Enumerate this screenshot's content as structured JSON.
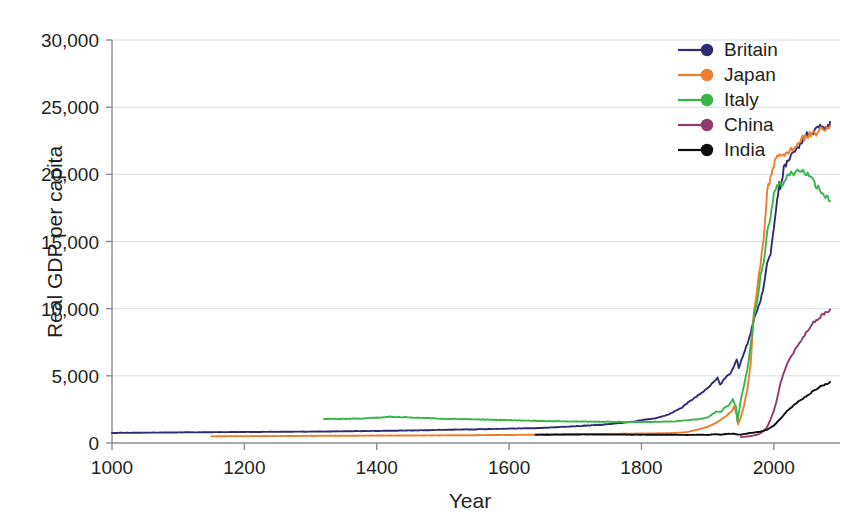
{
  "chart_data": {
    "type": "line",
    "title": "",
    "xlabel": "Year",
    "ylabel": "Real GDP per capita",
    "xlim": [
      1000,
      2100
    ],
    "ylim": [
      0,
      30000
    ],
    "xticks": [
      1000,
      1200,
      1400,
      1600,
      1800,
      2000
    ],
    "xticklabels": [
      "1000",
      "1200",
      "1400",
      "1600",
      "1800",
      "2000"
    ],
    "yticks": [
      0,
      5000,
      10000,
      15000,
      20000,
      25000,
      30000
    ],
    "yticklabels": [
      "0",
      "5,000",
      "10,000",
      "15,000",
      "20,000",
      "25,000",
      "30,000"
    ],
    "grid": true,
    "grid_axis": "y",
    "legend_position": "top-right",
    "series": [
      {
        "name": "Britain",
        "color": "#2e2d74",
        "x": [
          1000,
          1100,
          1200,
          1300,
          1350,
          1400,
          1450,
          1500,
          1550,
          1600,
          1650,
          1700,
          1720,
          1740,
          1760,
          1780,
          1800,
          1820,
          1840,
          1860,
          1870,
          1880,
          1890,
          1900,
          1910,
          1915,
          1919,
          1925,
          1930,
          1935,
          1940,
          1944,
          1947,
          1950,
          1955,
          1960,
          1965,
          1970,
          1975,
          1980,
          1985,
          1990,
          1995,
          2000,
          2005,
          2008,
          2010,
          2015,
          2020,
          2030,
          2040,
          2050,
          2060,
          2070,
          2080,
          2085
        ],
        "y": [
          750,
          790,
          820,
          850,
          870,
          900,
          930,
          980,
          1020,
          1070,
          1120,
          1250,
          1300,
          1360,
          1450,
          1540,
          1700,
          1830,
          2100,
          2600,
          3000,
          3350,
          3700,
          4100,
          4550,
          4900,
          4350,
          4750,
          5000,
          5200,
          5800,
          6200,
          5600,
          6000,
          6700,
          7400,
          8200,
          9200,
          9900,
          10600,
          11800,
          13300,
          14100,
          16100,
          18000,
          19300,
          18800,
          20400,
          20900,
          21600,
          22300,
          22900,
          23100,
          23600,
          23300,
          23900
        ]
      },
      {
        "name": "Japan",
        "color": "#ed7d31",
        "x": [
          1150,
          1200,
          1300,
          1400,
          1500,
          1600,
          1650,
          1700,
          1750,
          1800,
          1850,
          1870,
          1885,
          1900,
          1913,
          1925,
          1935,
          1940,
          1944,
          1946,
          1950,
          1955,
          1960,
          1965,
          1970,
          1975,
          1980,
          1985,
          1990,
          1995,
          2000,
          2005,
          2010,
          2020,
          2030,
          2040,
          2050,
          2060,
          2070,
          2080,
          2085
        ],
        "y": [
          500,
          510,
          530,
          550,
          570,
          600,
          620,
          650,
          680,
          700,
          740,
          820,
          1000,
          1200,
          1500,
          1900,
          2300,
          2700,
          2100,
          1400,
          1900,
          2800,
          4000,
          5900,
          9700,
          11500,
          13400,
          15400,
          18800,
          19700,
          20700,
          21400,
          21300,
          21600,
          22000,
          22500,
          22900,
          23000,
          23300,
          23500,
          23600
        ]
      },
      {
        "name": "Italy",
        "color": "#39b54a",
        "x": [
          1320,
          1350,
          1380,
          1400,
          1420,
          1450,
          1480,
          1500,
          1540,
          1580,
          1600,
          1650,
          1700,
          1750,
          1800,
          1820,
          1850,
          1870,
          1890,
          1900,
          1913,
          1920,
          1925,
          1930,
          1935,
          1938,
          1943,
          1945,
          1948,
          1950,
          1955,
          1960,
          1965,
          1970,
          1975,
          1980,
          1985,
          1990,
          1995,
          2000,
          2005,
          2008,
          2012,
          2016,
          2020,
          2040,
          2055,
          2065,
          2070,
          2080,
          2085
        ],
        "y": [
          1800,
          1790,
          1830,
          1880,
          1950,
          1900,
          1850,
          1800,
          1780,
          1720,
          1700,
          1640,
          1600,
          1580,
          1560,
          1580,
          1600,
          1700,
          1800,
          1900,
          2350,
          2300,
          2600,
          2750,
          3000,
          3250,
          2700,
          1600,
          2500,
          3200,
          4300,
          5500,
          7200,
          9500,
          10500,
          12500,
          13500,
          15800,
          16700,
          18500,
          19100,
          19500,
          18900,
          19400,
          19900,
          20300,
          19800,
          19100,
          18700,
          18300,
          18000
        ]
      },
      {
        "name": "China",
        "color": "#8e3c6b",
        "x": [
          1950,
          1960,
          1970,
          1978,
          1985,
          1990,
          1995,
          2000,
          2005,
          2010,
          2020,
          2035,
          2050,
          2060,
          2070,
          2080,
          2085
        ],
        "y": [
          440,
          480,
          560,
          680,
          900,
          1200,
          1750,
          2400,
          3300,
          4500,
          5900,
          7200,
          8300,
          9000,
          9400,
          9750,
          9950
        ]
      },
      {
        "name": "India",
        "color": "#0d0d0d",
        "x": [
          1640,
          1680,
          1700,
          1750,
          1800,
          1850,
          1870,
          1890,
          1900,
          1913,
          1920,
          1930,
          1940,
          1947,
          1950,
          1960,
          1970,
          1980,
          1990,
          2000,
          2010,
          2020,
          2035,
          2050,
          2060,
          2070,
          2080,
          2085
        ],
        "y": [
          620,
          630,
          640,
          630,
          620,
          610,
          600,
          620,
          600,
          660,
          620,
          680,
          690,
          620,
          620,
          710,
          780,
          850,
          1000,
          1300,
          1800,
          2400,
          3000,
          3500,
          3900,
          4200,
          4400,
          4550
        ]
      }
    ]
  },
  "axes": {
    "y_title": "Real GDP per capita",
    "x_title": "Year"
  },
  "legend": {
    "entries": [
      {
        "label": "Britain",
        "color": "#2e2d74"
      },
      {
        "label": "Japan",
        "color": "#ed7d31"
      },
      {
        "label": "Italy",
        "color": "#39b54a"
      },
      {
        "label": "China",
        "color": "#8e3c6b"
      },
      {
        "label": "India",
        "color": "#0d0d0d"
      }
    ]
  }
}
